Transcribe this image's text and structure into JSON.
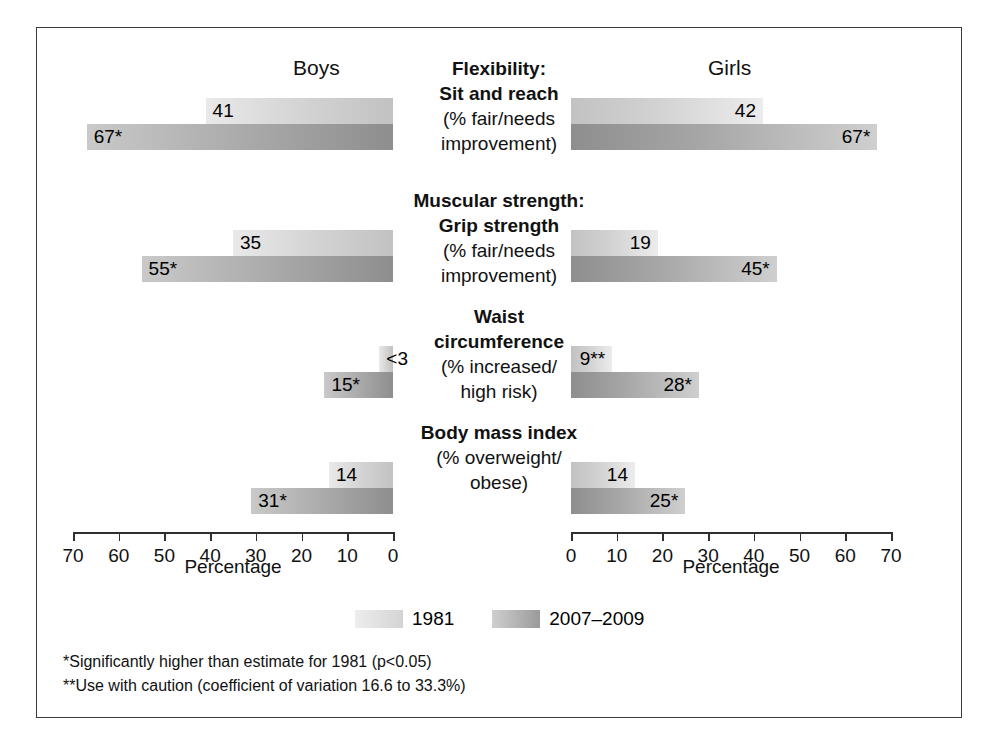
{
  "figure": {
    "panels": [
      {
        "key": "boys",
        "title": "Boys"
      },
      {
        "key": "girls",
        "title": "Girls"
      }
    ],
    "axis_title": "Percentage",
    "legend": [
      {
        "key": "y1981",
        "label": "1981"
      },
      {
        "key": "y2007",
        "label": "2007–2009"
      }
    ],
    "footnotes": [
      "*Significantly higher than estimate for 1981 (p<0.05)",
      "**Use with caution (coefficient of variation 16.6 to 33.3%)"
    ]
  },
  "ticks": {
    "left": [
      "70",
      "60",
      "50",
      "40",
      "30",
      "20",
      "10",
      "0"
    ],
    "right": [
      "0",
      "10",
      "20",
      "30",
      "40",
      "50",
      "60",
      "70"
    ]
  },
  "rows": [
    {
      "title_bold": [
        "Flexibility:",
        "Sit and reach"
      ],
      "title_plain": [
        "(% fair/needs",
        "improvement)"
      ],
      "boys": {
        "y1981": {
          "value": 41,
          "label": "41"
        },
        "y2007": {
          "value": 67,
          "label": "67*"
        }
      },
      "girls": {
        "y1981": {
          "value": 42,
          "label": "42"
        },
        "y2007": {
          "value": 67,
          "label": "67*"
        }
      }
    },
    {
      "title_bold": [
        "Muscular strength:",
        "Grip strength"
      ],
      "title_plain": [
        "(% fair/needs",
        "improvement)"
      ],
      "boys": {
        "y1981": {
          "value": 35,
          "label": "35"
        },
        "y2007": {
          "value": 55,
          "label": "55*"
        }
      },
      "girls": {
        "y1981": {
          "value": 19,
          "label": "19"
        },
        "y2007": {
          "value": 45,
          "label": "45*"
        }
      }
    },
    {
      "title_bold": [
        "Waist",
        "circumference"
      ],
      "title_plain": [
        "(% increased/",
        "high risk)"
      ],
      "boys": {
        "y1981": {
          "value": 3,
          "label": "<3"
        },
        "y2007": {
          "value": 15,
          "label": "15*"
        }
      },
      "girls": {
        "y1981": {
          "value": 9,
          "label": "9**"
        },
        "y2007": {
          "value": 28,
          "label": "28*"
        }
      }
    },
    {
      "title_bold": [
        "Body mass index"
      ],
      "title_plain": [
        "(% overweight/",
        "obese)"
      ],
      "boys": {
        "y1981": {
          "value": 14,
          "label": "14"
        },
        "y2007": {
          "value": 31,
          "label": "31*"
        }
      },
      "girls": {
        "y1981": {
          "value": 14,
          "label": "14"
        },
        "y2007": {
          "value": 25,
          "label": "25*"
        }
      }
    }
  ],
  "chart_data": {
    "type": "bar",
    "title": "",
    "xlabel": "Percentage",
    "ylabel": "",
    "xlim": [
      0,
      70
    ],
    "grid": false,
    "legend_position": "bottom-center",
    "orientation": "horizontal",
    "panels": [
      "Boys",
      "Girls"
    ],
    "categories": [
      "Flexibility: Sit and reach (% fair/needs improvement)",
      "Muscular strength: Grip strength (% fair/needs improvement)",
      "Waist circumference (% increased/high risk)",
      "Body mass index (% overweight/obese)"
    ],
    "series": [
      {
        "name": "1981",
        "panel": "Boys",
        "values": [
          41,
          35,
          3,
          14
        ],
        "labels": [
          "41",
          "35",
          "<3",
          "14"
        ]
      },
      {
        "name": "2007-2009",
        "panel": "Boys",
        "values": [
          67,
          55,
          15,
          31
        ],
        "labels": [
          "67*",
          "55*",
          "15*",
          "31*"
        ]
      },
      {
        "name": "1981",
        "panel": "Girls",
        "values": [
          42,
          19,
          9,
          14
        ],
        "labels": [
          "42",
          "19",
          "9**",
          "14"
        ]
      },
      {
        "name": "2007-2009",
        "panel": "Girls",
        "values": [
          67,
          45,
          28,
          25
        ],
        "labels": [
          "67*",
          "45*",
          "28*",
          "25*"
        ]
      }
    ],
    "annotations": [
      "*Significantly higher than estimate for 1981 (p<0.05)",
      "**Use with caution (coefficient of variation 16.6 to 33.3%)"
    ]
  }
}
